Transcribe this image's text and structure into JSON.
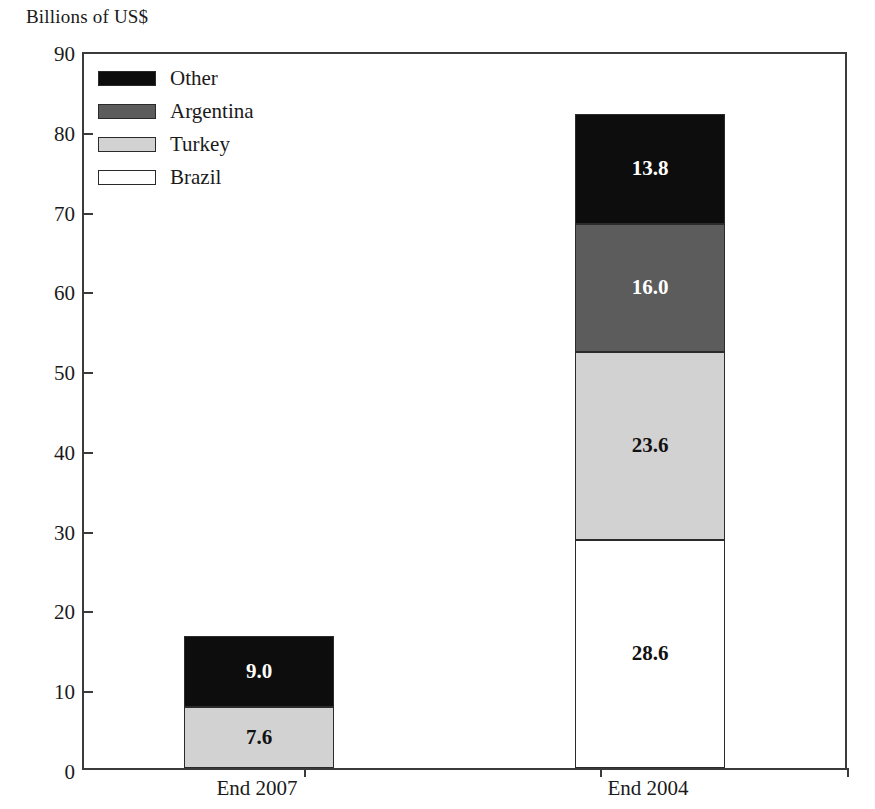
{
  "chart_data": {
    "type": "bar",
    "subtype": "stacked-vertical",
    "title": "Billions of US$",
    "xlabel": "",
    "ylabel": "Billions of US$",
    "ylim": [
      0,
      90
    ],
    "ytick_step": 10,
    "ytick_labels": [
      "90",
      "80",
      "70",
      "60",
      "50",
      "40",
      "30",
      "20",
      "10",
      "0"
    ],
    "ytick_values": [
      90,
      80,
      70,
      60,
      50,
      40,
      30,
      20,
      10,
      0
    ],
    "grid": false,
    "legend_position": "top-left-inside",
    "categories": [
      "End 2007",
      "End 2004"
    ],
    "series": [
      {
        "name": "Brazil",
        "color": "#ffffff",
        "values": [
          0.0,
          28.6
        ],
        "labels": [
          "",
          "28.6"
        ]
      },
      {
        "name": "Turkey",
        "color": "#d2d2d2",
        "values": [
          7.6,
          23.6
        ],
        "labels": [
          "7.6",
          "23.6"
        ]
      },
      {
        "name": "Argentina",
        "color": "#5c5c5c",
        "values": [
          0.0,
          16.0
        ],
        "labels": [
          "",
          "16.0"
        ]
      },
      {
        "name": "Other",
        "color": "#0d0d0d",
        "values": [
          9.0,
          13.8
        ],
        "labels": [
          "9.0",
          "13.8"
        ]
      }
    ],
    "totals": [
      16.6,
      82.0
    ]
  },
  "legend": {
    "items": [
      {
        "label": "Other",
        "color": "#0d0d0d"
      },
      {
        "label": "Argentina",
        "color": "#5c5c5c"
      },
      {
        "label": "Turkey",
        "color": "#d2d2d2"
      },
      {
        "label": "Brazil",
        "color": "#ffffff"
      }
    ]
  },
  "axis": {
    "y_labels": [
      "90",
      "80",
      "70",
      "60",
      "50",
      "40",
      "30",
      "20",
      "10",
      "0"
    ],
    "x_labels": [
      "End 2007",
      "End 2004"
    ]
  },
  "values": {
    "end2007": {
      "turkey": "7.6",
      "other": "9.0"
    },
    "end2004": {
      "brazil": "28.6",
      "turkey": "23.6",
      "argentina": "16.0",
      "other": "13.8"
    }
  },
  "colors": {
    "other": "#0d0d0d",
    "argentina": "#5c5c5c",
    "turkey": "#d2d2d2",
    "brazil": "#ffffff",
    "axis": "#3b3b3b",
    "text": "#1a1a1a"
  }
}
